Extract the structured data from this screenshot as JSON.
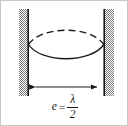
{
  "figure": {
    "name": "standing-wave-between-two-walls",
    "background_color": "#ffffff",
    "border_color": "#c8c8c8",
    "ink_color": "#1a1a1a",
    "hatch_color": "#8c8c8c",
    "walls": {
      "left": {
        "label": "left-wall",
        "hatch_x": 18,
        "hatch_width": 9,
        "line_x": 27,
        "top_y": 8,
        "bottom_y": 95
      },
      "right": {
        "label": "right-wall",
        "hatch_x": 104,
        "hatch_width": 9,
        "line_x": 103,
        "top_y": 8,
        "bottom_y": 95
      }
    },
    "wave": {
      "node_left_x": 27,
      "node_right_x": 103,
      "node_y": 43,
      "crest_y": 26,
      "trough_y": 59,
      "upper_style": "dashed",
      "lower_style": "solid",
      "dash_pattern": "7,4"
    },
    "dimension_arrow": {
      "label": "cavity-length-arrow",
      "y": 86,
      "x_start": 28,
      "x_end": 102,
      "heads": "both"
    },
    "equation": {
      "variable": "e",
      "relation": "=",
      "numerator": "λ",
      "denominator": "2",
      "plain": "e = λ/2"
    }
  }
}
